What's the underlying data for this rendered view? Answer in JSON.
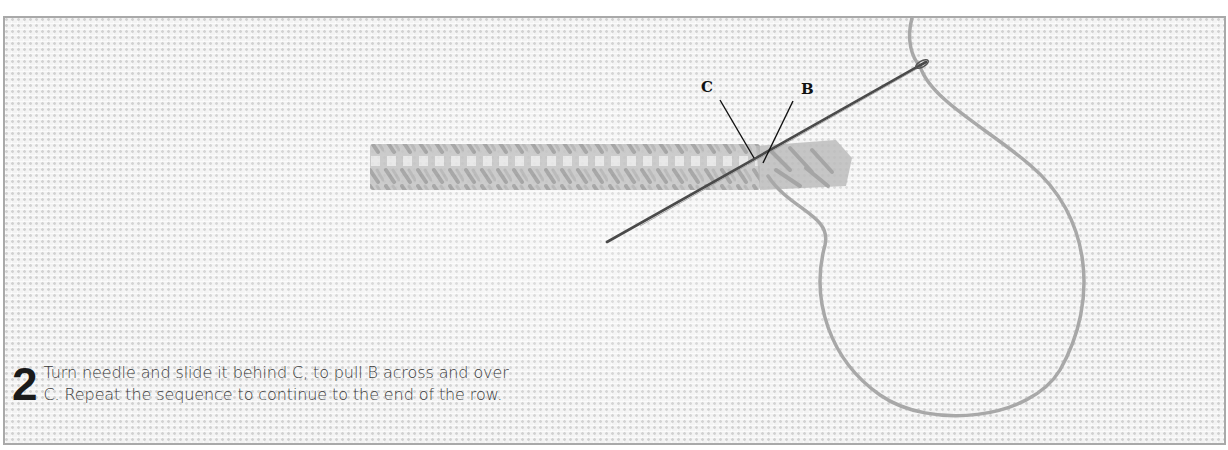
{
  "figure": {
    "step_number": "2",
    "caption": "Turn needle and slide it behind C, to pull B across and over C. Repeat the sequence to continue to the end of the row.",
    "labels": [
      {
        "id": "C",
        "text": "C"
      },
      {
        "id": "B",
        "text": "B"
      }
    ],
    "elements": {
      "fabric": "evenweave-linen-background",
      "stitched_band": "worked-stitch-row",
      "needle": "tapestry-needle",
      "thread": "working-thread-loop"
    },
    "colors": {
      "frame_border": "#a9a9a9",
      "fabric": "#f3f3f3",
      "thread": "#a8a8a8",
      "needle": "#555555",
      "text": "#3a3a3a"
    }
  }
}
